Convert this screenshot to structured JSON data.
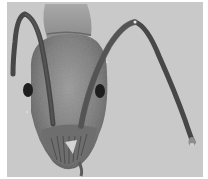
{
  "image": {
    "subject": "Ant head, frontal view",
    "alt": "Grayscale micrograph of an ant head with two elbowed antennae, compound eyes and mandibles",
    "style": "grayscale photograph",
    "colors": {
      "page_background": "#ffffff",
      "photo_background": "#c9c9c9",
      "head_mid": "#8a8a8a",
      "head_dark": "#5a5a5a",
      "antenna": "#4a4a4a",
      "eye": "#1e1e1e",
      "highlight": "#e6e6e6"
    }
  }
}
